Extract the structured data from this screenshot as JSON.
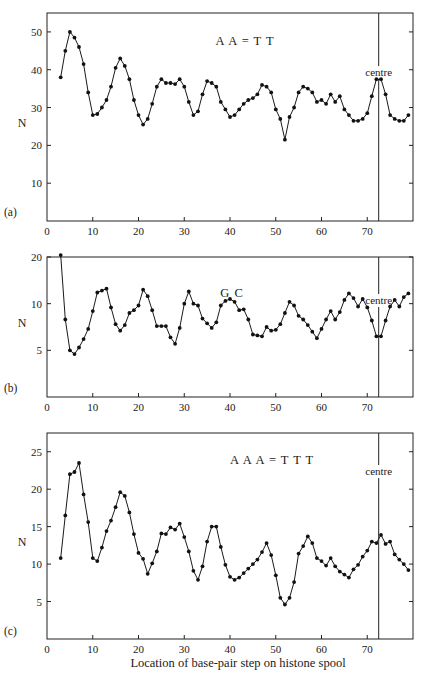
{
  "chart_data": [
    {
      "type": "line",
      "panel_label": "(a)",
      "title": "A A = T T",
      "annotation": "centre",
      "annotation_x": 72.5,
      "xlabel": "",
      "ylabel": "N",
      "xlim": [
        0,
        80
      ],
      "ylim": [
        0,
        55
      ],
      "xticks": [
        0,
        10,
        20,
        30,
        40,
        50,
        60,
        70
      ],
      "yticks": [
        10,
        20,
        30,
        40,
        50
      ],
      "ytick_labels": [
        "10",
        "20",
        "30",
        "40",
        "50"
      ],
      "grid": false,
      "x": [
        3,
        4,
        5,
        6,
        7,
        8,
        9,
        10,
        11,
        12,
        13,
        14,
        15,
        16,
        17,
        18,
        19,
        20,
        21,
        22,
        23,
        24,
        25,
        26,
        27,
        28,
        29,
        30,
        31,
        32,
        33,
        34,
        35,
        36,
        37,
        38,
        39,
        40,
        41,
        42,
        43,
        44,
        45,
        46,
        47,
        48,
        49,
        50,
        51,
        52,
        53,
        54,
        55,
        56,
        57,
        58,
        59,
        60,
        61,
        62,
        63,
        64,
        65,
        66,
        67,
        68,
        69,
        70,
        71,
        72,
        73,
        74,
        75,
        76,
        77,
        78,
        79
      ],
      "values": [
        38,
        45,
        50,
        48.5,
        46,
        41.5,
        34,
        28,
        28.3,
        30,
        32,
        35.5,
        40.5,
        43,
        41,
        37.5,
        32,
        28,
        25.5,
        27,
        31,
        35.5,
        37.5,
        36.5,
        36.5,
        36.2,
        37.5,
        35.5,
        31.5,
        28,
        29,
        33.5,
        37,
        36.5,
        35.5,
        31.5,
        29.5,
        27.5,
        28,
        29.5,
        31,
        32,
        32.5,
        33.5,
        36,
        35.5,
        34,
        29.5,
        27,
        21.5,
        27.5,
        30,
        34,
        35.5,
        35,
        34,
        31.5,
        32,
        31,
        33.5,
        31.5,
        33,
        29.5,
        28,
        26.5,
        26.5,
        27,
        28.5,
        33,
        37.5,
        37.5,
        33.5,
        28,
        27,
        26.5,
        26.5,
        28
      ]
    },
    {
      "type": "line",
      "panel_label": "(b)",
      "title": "G C",
      "annotation": "centre",
      "annotation_x": 72.5,
      "xlabel": "",
      "ylabel": "N",
      "xlim": [
        0,
        80
      ],
      "ylim": [
        0,
        15
      ],
      "xticks": [
        0,
        10,
        20,
        30,
        40,
        50,
        60,
        70
      ],
      "yticks": [
        5,
        10,
        15
      ],
      "ytick_labels": [
        "5",
        "10",
        "20"
      ],
      "grid": false,
      "x": [
        3,
        4,
        5,
        6,
        7,
        8,
        9,
        10,
        11,
        12,
        13,
        14,
        15,
        16,
        17,
        18,
        19,
        20,
        21,
        22,
        23,
        24,
        25,
        26,
        27,
        28,
        29,
        30,
        31,
        32,
        33,
        34,
        35,
        36,
        37,
        38,
        39,
        40,
        41,
        42,
        43,
        44,
        45,
        46,
        47,
        48,
        49,
        50,
        51,
        52,
        53,
        54,
        55,
        56,
        57,
        58,
        59,
        60,
        61,
        62,
        63,
        64,
        65,
        66,
        67,
        68,
        69,
        70,
        71,
        72,
        73,
        74,
        75,
        76,
        77,
        78,
        79
      ],
      "values": [
        15.2,
        8.3,
        5.0,
        4.6,
        5.3,
        6.2,
        7.3,
        9.2,
        11.2,
        11.4,
        11.6,
        9.6,
        7.8,
        7.1,
        7.7,
        9.0,
        9.3,
        9.8,
        11.5,
        10.8,
        9.3,
        7.6,
        7.6,
        7.6,
        6.4,
        5.7,
        7.4,
        10.0,
        11.3,
        10.0,
        9.8,
        8.4,
        7.9,
        7.4,
        8.0,
        9.8,
        10.3,
        10.5,
        10.2,
        9.3,
        9.4,
        8.3,
        6.7,
        6.6,
        6.5,
        7.5,
        7.1,
        7.2,
        7.8,
        9.0,
        10.2,
        9.8,
        8.7,
        8.3,
        7.7,
        7.0,
        6.3,
        7.3,
        8.3,
        9.2,
        8.3,
        9.1,
        10.4,
        11.1,
        10.6,
        9.7,
        10.5,
        9.6,
        8.2,
        6.5,
        6.5,
        8.2,
        9.7,
        10.4,
        9.7,
        10.7,
        11.1
      ]
    },
    {
      "type": "line",
      "panel_label": "(c)",
      "title": "A A A = T T T",
      "annotation": "centre",
      "annotation_x": 72.5,
      "xlabel": "Location of base-pair step on histone spool",
      "ylabel": "N",
      "xlim": [
        0,
        80
      ],
      "ylim": [
        0,
        27.5
      ],
      "xticks": [
        0,
        10,
        20,
        30,
        40,
        50,
        60,
        70
      ],
      "yticks": [
        5,
        10,
        15,
        20,
        25
      ],
      "ytick_labels": [
        "5",
        "10",
        "15",
        "20",
        "25"
      ],
      "grid": false,
      "x": [
        3,
        4,
        5,
        6,
        7,
        8,
        9,
        10,
        11,
        12,
        13,
        14,
        15,
        16,
        17,
        18,
        19,
        20,
        21,
        22,
        23,
        24,
        25,
        26,
        27,
        28,
        29,
        30,
        31,
        32,
        33,
        34,
        35,
        36,
        37,
        38,
        39,
        40,
        41,
        42,
        43,
        44,
        45,
        46,
        47,
        48,
        49,
        50,
        51,
        52,
        53,
        54,
        55,
        56,
        57,
        58,
        59,
        60,
        61,
        62,
        63,
        64,
        65,
        66,
        67,
        68,
        69,
        70,
        71,
        72,
        73,
        74,
        75,
        76,
        77,
        78,
        79
      ],
      "values": [
        10.8,
        16.5,
        22.0,
        22.3,
        23.5,
        19.3,
        15.6,
        10.8,
        10.4,
        12.2,
        14.4,
        15.8,
        17.6,
        19.6,
        19.1,
        16.9,
        14.0,
        11.5,
        10.7,
        8.7,
        10.1,
        11.7,
        14.1,
        14.0,
        14.9,
        14.6,
        15.4,
        13.6,
        11.7,
        9.1,
        7.9,
        9.7,
        13.0,
        15.0,
        15.0,
        12.3,
        9.9,
        8.3,
        7.9,
        8.2,
        8.8,
        9.4,
        10.0,
        10.6,
        11.6,
        12.8,
        11.2,
        8.5,
        5.5,
        4.6,
        5.5,
        7.6,
        11.4,
        12.4,
        13.7,
        12.8,
        10.8,
        10.4,
        9.8,
        10.8,
        9.7,
        9.0,
        8.6,
        8.2,
        9.3,
        9.9,
        11.0,
        11.8,
        13.0,
        12.8,
        13.9,
        12.7,
        13.0,
        11.3,
        10.6,
        10.0,
        9.2
      ]
    }
  ],
  "figure": {
    "panels": [
      {
        "label": "(a)",
        "title": "A A = T T",
        "ylabel": "N",
        "centre_label": "centre"
      },
      {
        "label": "(b)",
        "title": "G C",
        "ylabel": "N",
        "centre_label": "centre"
      },
      {
        "label": "(c)",
        "title": "A A A = T T T",
        "ylabel": "N",
        "centre_label": "centre"
      }
    ],
    "xlabel": "Location of base-pair step on histone spool"
  }
}
